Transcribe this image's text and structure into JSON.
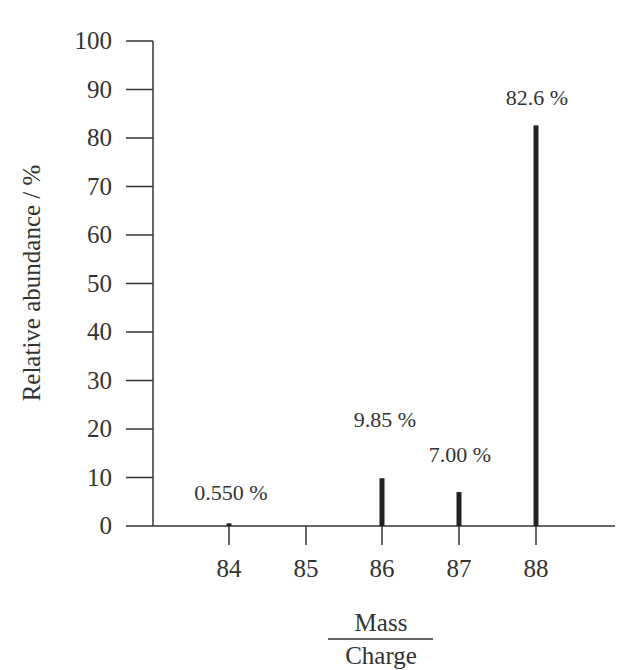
{
  "chart_data": {
    "type": "bar",
    "title": "",
    "xlabel_numerator": "Mass",
    "xlabel_denominator": "Charge",
    "ylabel": "Relative abundance / %",
    "categories": [
      "84",
      "85",
      "86",
      "87",
      "88"
    ],
    "values": [
      0.55,
      0,
      9.85,
      7.0,
      82.6
    ],
    "data_labels": [
      "0.550 %",
      "",
      "9.85 %",
      "7.00 %",
      "82.6 %"
    ],
    "ylim": [
      0,
      100
    ],
    "yticks": [
      0,
      10,
      20,
      30,
      40,
      50,
      60,
      70,
      80,
      90,
      100
    ],
    "grid": false,
    "legend": null
  },
  "colors": {
    "axis": "#333333",
    "bar": "#222222",
    "text": "#333333"
  }
}
